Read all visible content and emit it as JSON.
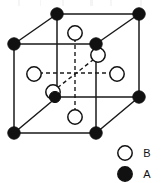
{
  "figure": {
    "type": "crystal-unit-cell-diagram",
    "line_color": "#1a1a1a",
    "atom_fill_A": "#111111",
    "atom_fill_B": "#ffffff",
    "atom_stroke": "#111111",
    "background": "#ffffff"
  },
  "cube": {
    "solid_edges": [
      {
        "name": "top-front-edge",
        "x1": 14,
        "y1": 44,
        "x2": 96,
        "y2": 44
      },
      {
        "name": "top-back-edge",
        "x1": 57,
        "y1": 14,
        "x2": 139,
        "y2": 14
      },
      {
        "name": "top-left-edge",
        "x1": 14,
        "y1": 44,
        "x2": 57,
        "y2": 14
      },
      {
        "name": "top-right-edge",
        "x1": 96,
        "y1": 44,
        "x2": 139,
        "y2": 14
      },
      {
        "name": "bottom-front-edge",
        "x1": 14,
        "y1": 133,
        "x2": 96,
        "y2": 133
      },
      {
        "name": "bottom-back-edge",
        "x1": 57,
        "y1": 97,
        "x2": 139,
        "y2": 97
      },
      {
        "name": "bottom-left-edge",
        "x1": 14,
        "y1": 133,
        "x2": 57,
        "y2": 97
      },
      {
        "name": "bottom-right-edge",
        "x1": 96,
        "y1": 133,
        "x2": 139,
        "y2": 97
      },
      {
        "name": "vertical-front-left",
        "x1": 14,
        "y1": 44,
        "x2": 14,
        "y2": 133
      },
      {
        "name": "vertical-front-right",
        "x1": 96,
        "y1": 44,
        "x2": 96,
        "y2": 133
      },
      {
        "name": "vertical-back-left",
        "x1": 57,
        "y1": 14,
        "x2": 57,
        "y2": 97
      },
      {
        "name": "vertical-back-right",
        "x1": 139,
        "y1": 14,
        "x2": 139,
        "y2": 97
      }
    ],
    "dashed_axes": [
      {
        "name": "axis-vertical",
        "x1": 75,
        "y1": 31,
        "x2": 75,
        "y2": 115
      },
      {
        "name": "axis-horizontal",
        "x1": 32,
        "y1": 73,
        "x2": 118,
        "y2": 73
      },
      {
        "name": "axis-diagonal",
        "x1": 52,
        "y1": 92,
        "x2": 98,
        "y2": 56
      }
    ]
  },
  "atoms": {
    "corner_A": [
      {
        "name": "corner-back-top-left",
        "cx": 57,
        "cy": 14,
        "r": 6.2
      },
      {
        "name": "corner-back-top-right",
        "cx": 139,
        "cy": 14,
        "r": 6.2
      },
      {
        "name": "corner-front-top-left",
        "cx": 14,
        "cy": 44,
        "r": 6.2
      },
      {
        "name": "corner-front-top-right",
        "cx": 96,
        "cy": 44,
        "r": 6.2
      },
      {
        "name": "corner-back-bottom-right",
        "cx": 139,
        "cy": 97,
        "r": 6.2
      },
      {
        "name": "corner-front-bottom-left",
        "cx": 14,
        "cy": 133,
        "r": 6.2
      },
      {
        "name": "corner-front-bottom-right",
        "cx": 96,
        "cy": 133,
        "r": 6.2
      },
      {
        "name": "atom-interior-A",
        "cx": 55,
        "cy": 97,
        "r": 5.6
      }
    ],
    "face_B": [
      {
        "name": "face-centre-top",
        "cx": 75,
        "cy": 33,
        "r": 7.2
      },
      {
        "name": "face-centre-bottom",
        "cx": 75,
        "cy": 117,
        "r": 7.2
      },
      {
        "name": "face-centre-left",
        "cx": 34,
        "cy": 74,
        "r": 7.2
      },
      {
        "name": "face-centre-right",
        "cx": 117,
        "cy": 74,
        "r": 7.2
      },
      {
        "name": "face-centre-back-upper",
        "cx": 98,
        "cy": 55,
        "r": 7.2
      },
      {
        "name": "face-centre-front-lower",
        "cx": 53,
        "cy": 92,
        "r": 7.2
      }
    ]
  },
  "legend": {
    "items": [
      {
        "symbol": "open-circle",
        "label": "B",
        "cx": 125,
        "cy": 153,
        "r": 7.2,
        "label_x": 147,
        "label_y": 157
      },
      {
        "symbol": "filled-circle",
        "label": "A",
        "cx": 125,
        "cy": 174,
        "r": 7.2,
        "label_x": 147,
        "label_y": 178
      }
    ]
  }
}
